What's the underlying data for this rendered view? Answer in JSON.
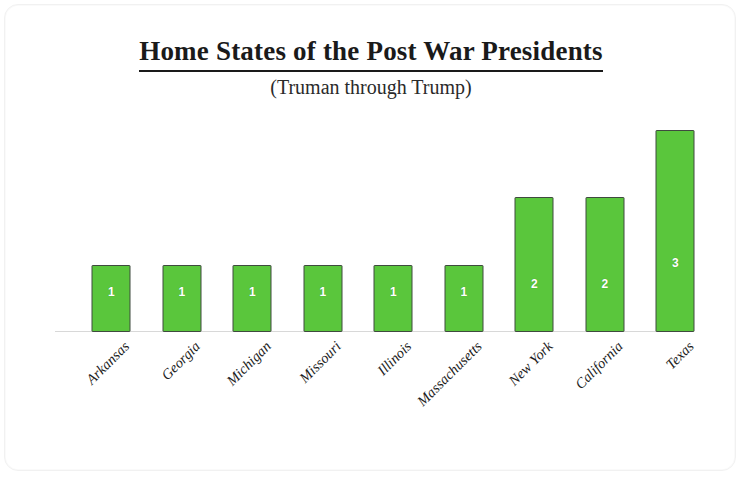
{
  "chart_data": {
    "type": "bar",
    "title": "Home States of the Post War Presidents",
    "subtitle": "(Truman through Trump)",
    "xlabel": "",
    "ylabel": "",
    "ylim": [
      0,
      3.3
    ],
    "grid": false,
    "legend": "none",
    "bar_color": "#5ac63c",
    "bar_border_color": "#3f4a3f",
    "data_label_color": "#ffffff",
    "axis_line_color": "#d8d8d8",
    "categories": [
      "Arkansas",
      "Georgia",
      "Michigan",
      "Missouri",
      "Illinois",
      "Massachusetts",
      "New York",
      "California",
      "Texas"
    ],
    "values": [
      1,
      1,
      1,
      1,
      1,
      1,
      2,
      2,
      3
    ],
    "data_labels": [
      "1",
      "1",
      "1",
      "1",
      "1",
      "1",
      "2",
      "2",
      "3"
    ],
    "bars": [
      {
        "label": "Arkansas",
        "value": 1,
        "data_label": "1"
      },
      {
        "label": "Georgia",
        "value": 1,
        "data_label": "1"
      },
      {
        "label": "Michigan",
        "value": 1,
        "data_label": "1"
      },
      {
        "label": "Missouri",
        "value": 1,
        "data_label": "1"
      },
      {
        "label": "Illinois",
        "value": 1,
        "data_label": "1"
      },
      {
        "label": "Massachusetts",
        "value": 1,
        "data_label": "1"
      },
      {
        "label": "New York",
        "value": 2,
        "data_label": "2"
      },
      {
        "label": "California",
        "value": 2,
        "data_label": "2"
      },
      {
        "label": "Texas",
        "value": 3,
        "data_label": "3"
      }
    ]
  }
}
